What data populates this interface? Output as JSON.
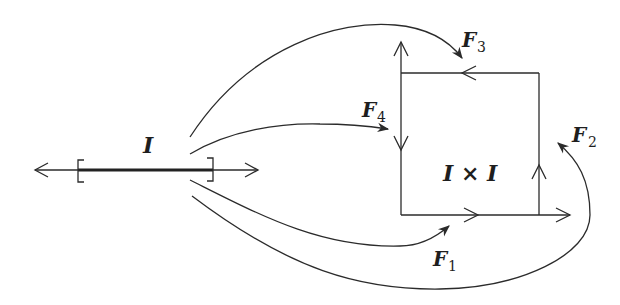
{
  "diagram": {
    "interval_label": "I",
    "square_label": "I × I",
    "maps": [
      {
        "name": "F",
        "subscript": "1",
        "target": "bottom edge"
      },
      {
        "name": "F",
        "subscript": "2",
        "target": "right edge"
      },
      {
        "name": "F",
        "subscript": "3",
        "target": "top edge"
      },
      {
        "name": "F",
        "subscript": "4",
        "target": "left edge"
      }
    ],
    "colors": {
      "ink": "#2b2b2b",
      "background": "#ffffff"
    }
  }
}
